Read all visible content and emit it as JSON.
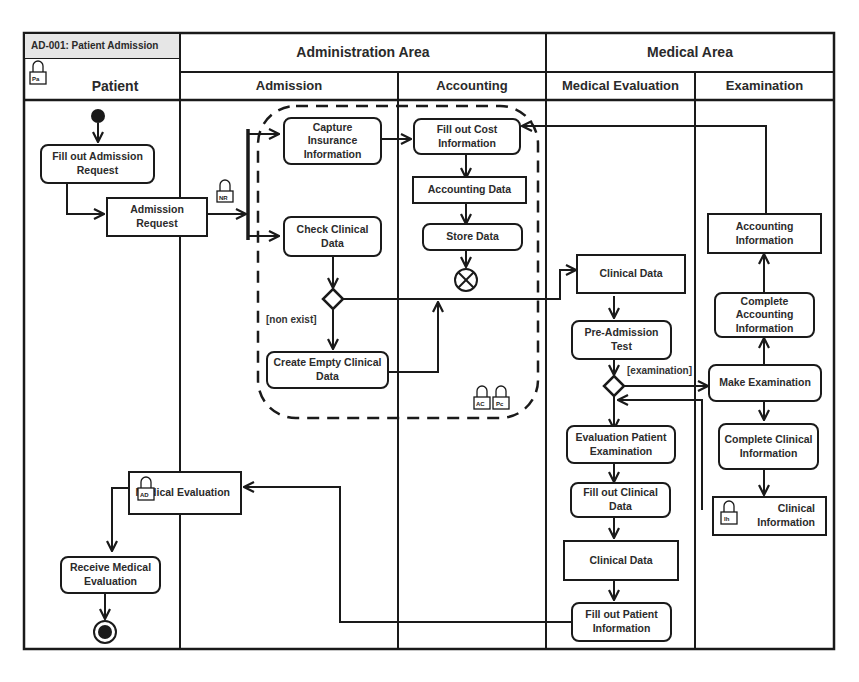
{
  "diagram": {
    "id_tag": "AD-001: Patient Admission",
    "areas": [
      {
        "label": "Administration Area"
      },
      {
        "label": "Medical Area"
      }
    ],
    "lanes": [
      {
        "label": "Patient",
        "lock_icon": "Pa"
      },
      {
        "label": "Admission"
      },
      {
        "label": "Accounting"
      },
      {
        "label": "Medical Evaluation"
      },
      {
        "label": "Examination"
      }
    ],
    "nodes": {
      "fill_out_admission_request": "Fill out Admission Request",
      "admission_request": "Admission Request",
      "capture_insurance": "Capture Insurance Information",
      "check_clinical_data": "Check Clinical Data",
      "create_empty_clinical": "Create Empty Clinical Data",
      "fill_out_cost": "Fill out Cost Information",
      "accounting_data": "Accounting Data",
      "store_data": "Store Data",
      "clinical_data_1": "Clinical Data",
      "pre_admission_test": "Pre-Admission Test",
      "evaluation_patient_exam": "Evaluation Patient Examination",
      "fill_out_clinical_data": "Fill out Clinical Data",
      "clinical_data_2": "Clinical Data",
      "fill_out_patient_info": "Fill out Patient Information",
      "accounting_information": "Accounting Information",
      "complete_accounting_info": "Complete Accounting Information",
      "make_examination": "Make Examination",
      "complete_clinical_info": "Complete Clinical Information",
      "clinical_information": "Clinical Information",
      "medical_evaluation": "Medical Evaluation",
      "receive_medical_evaluation": "Receive Medical Evaluation"
    },
    "guards": {
      "non_exist": "[non exist]",
      "examination": "[examination]"
    },
    "lock_tags": {
      "patient": "Pa",
      "admission_request": "NR",
      "region_ac": "AC",
      "region_pc": "Pc",
      "clinical_information": "Ih",
      "medical_evaluation": "AD"
    },
    "colors": {
      "line": "#1a1a1a",
      "tag_bg": "#e6e6e6",
      "background": "#ffffff"
    }
  }
}
